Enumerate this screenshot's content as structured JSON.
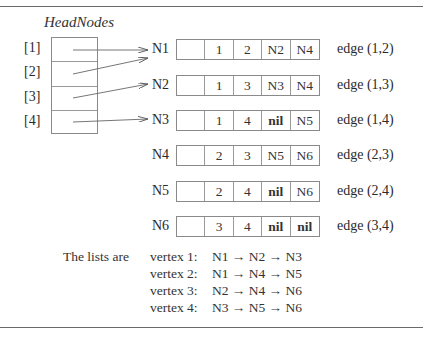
{
  "head": {
    "title": "HeadNodes",
    "indices": [
      "[1]",
      "[2]",
      "[3]",
      "[4]"
    ]
  },
  "nodes": [
    {
      "label": "N1",
      "cells": [
        "",
        "1",
        "2",
        "N2",
        "N4"
      ],
      "edge": "edge (1,2)"
    },
    {
      "label": "N2",
      "cells": [
        "",
        "1",
        "3",
        "N3",
        "N4"
      ],
      "edge": "edge (1,3)"
    },
    {
      "label": "N3",
      "cells": [
        "",
        "1",
        "4",
        "nil",
        "N5"
      ],
      "edge": "edge (1,4)"
    },
    {
      "label": "N4",
      "cells": [
        "",
        "2",
        "3",
        "N5",
        "N6"
      ],
      "edge": "edge (2,3)"
    },
    {
      "label": "N5",
      "cells": [
        "",
        "2",
        "4",
        "nil",
        "N6"
      ],
      "edge": "edge (2,4)"
    },
    {
      "label": "N6",
      "cells": [
        "",
        "3",
        "4",
        "nil",
        "nil"
      ],
      "edge": "edge (3,4)"
    }
  ],
  "lists": {
    "label": "The lists are",
    "rows": [
      {
        "vertex": "vertex 1:",
        "path": "N1 → N2 → N3"
      },
      {
        "vertex": "vertex 2:",
        "path": "N1 → N4 → N5"
      },
      {
        "vertex": "vertex 3:",
        "path": "N2 → N4 → N6"
      },
      {
        "vertex": "vertex 4:",
        "path": "N3 → N5 → N6"
      }
    ]
  }
}
